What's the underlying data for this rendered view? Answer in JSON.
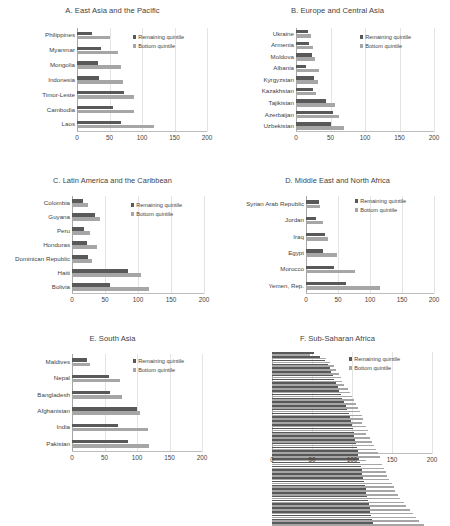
{
  "figure": {
    "legend_labels": {
      "remaining": "Remaining quintile",
      "bottom": "Bottom quintile"
    },
    "colors": {
      "remaining": "#595959",
      "bottom": "#a6a6a6",
      "gridline": "#e4e4e4",
      "axis": "#a6a6a6",
      "text": "#3f3f3f",
      "background": "#ffffff"
    }
  },
  "chart_data": [
    {
      "id": "A",
      "type": "bar",
      "orientation": "horizontal",
      "title": "A. East Asia and the Pacific",
      "xlabel": "",
      "ylabel": "",
      "xlim": [
        0,
        200
      ],
      "xticks": [
        0,
        50,
        100,
        150,
        200
      ],
      "grid": true,
      "legend_position": "upper-right",
      "categories": [
        "Philippines",
        "Myanmar",
        "Mongolia",
        "Indonesia",
        "Timor-Leste",
        "Cambodia",
        "Laos"
      ],
      "series": [
        {
          "name": "Remaining quintile",
          "values": [
            23,
            37,
            33,
            34,
            73,
            55,
            68
          ]
        },
        {
          "name": "Bottom quintile",
          "values": [
            50,
            63,
            68,
            70,
            87,
            88,
            118
          ]
        }
      ]
    },
    {
      "id": "B",
      "type": "bar",
      "orientation": "horizontal",
      "title": "B. Europe and Central Asia",
      "xlabel": "",
      "ylabel": "",
      "xlim": [
        0,
        200
      ],
      "xticks": [
        0,
        50,
        100,
        150,
        200
      ],
      "grid": true,
      "legend_position": "upper-right",
      "categories": [
        "Ukraine",
        "Armenia",
        "Moldova",
        "Albania",
        "Kyrgyzstan",
        "Kazakhstan",
        "Tajikistan",
        "Azerbaijan",
        "Uzbekistan"
      ],
      "series": [
        {
          "name": "Remaining quintile",
          "values": [
            17,
            19,
            23,
            14,
            26,
            24,
            44,
            53,
            51
          ]
        },
        {
          "name": "Bottom quintile",
          "values": [
            22,
            24,
            28,
            34,
            32,
            29,
            57,
            62,
            70
          ]
        }
      ]
    },
    {
      "id": "C",
      "type": "bar",
      "orientation": "horizontal",
      "title": "C. Latin America and the Caribbean",
      "xlabel": "",
      "ylabel": "",
      "xlim": [
        0,
        200
      ],
      "xticks": [
        0,
        50,
        100,
        150,
        200
      ],
      "grid": true,
      "legend_position": "upper-right",
      "categories": [
        "Colombia",
        "Guyana",
        "Peru",
        "Honduras",
        "Dominican Republic",
        "Haiti",
        "Bolivia"
      ],
      "series": [
        {
          "name": "Remaining quintile",
          "values": [
            16,
            35,
            18,
            22,
            24,
            85,
            57
          ]
        },
        {
          "name": "Bottom quintile",
          "values": [
            24,
            43,
            28,
            38,
            31,
            104,
            117
          ]
        }
      ]
    },
    {
      "id": "D",
      "type": "bar",
      "orientation": "horizontal",
      "title": "D. Middle East and North Africa",
      "xlabel": "",
      "ylabel": "",
      "xlim": [
        0,
        200
      ],
      "xticks": [
        0,
        50,
        100,
        150,
        200
      ],
      "grid": true,
      "legend_position": "upper-right",
      "categories": [
        "Syrian Arab Republic",
        "Jordan",
        "Iraq",
        "Egypt",
        "Morocco",
        "Yemen, Rep."
      ],
      "series": [
        {
          "name": "Remaining quintile",
          "values": [
            21,
            15,
            30,
            27,
            44,
            63
          ]
        },
        {
          "name": "Bottom quintile",
          "values": [
            22,
            27,
            35,
            48,
            76,
            116
          ]
        }
      ]
    },
    {
      "id": "E",
      "type": "bar",
      "orientation": "horizontal",
      "title": "E. South Asia",
      "xlabel": "",
      "ylabel": "",
      "xlim": [
        0,
        200
      ],
      "xticks": [
        0,
        50,
        100,
        150,
        200
      ],
      "grid": true,
      "legend_position": "upper-right",
      "categories": [
        "Maldives",
        "Nepal",
        "Bangladesh",
        "Afghanistan",
        "India",
        "Pakistan"
      ],
      "series": [
        {
          "name": "Remaining quintile",
          "values": [
            23,
            57,
            58,
            100,
            71,
            86
          ]
        },
        {
          "name": "Bottom quintile",
          "values": [
            28,
            74,
            77,
            105,
            117,
            118
          ]
        }
      ]
    },
    {
      "id": "F",
      "type": "bar",
      "orientation": "horizontal",
      "title": "F. Sub-Saharan Africa",
      "xlabel": "",
      "ylabel": "",
      "xlim": [
        0,
        200
      ],
      "xticks": [
        0,
        50,
        100,
        150,
        200
      ],
      "grid": true,
      "legend_position": "upper-right",
      "note": "Country labels rendered below legible resolution in source image",
      "categories": [
        "",
        "",
        "",
        "",
        "",
        "",
        "",
        "",
        "",
        "",
        "",
        "",
        "",
        "",
        "",
        "",
        "",
        "",
        "",
        "",
        "",
        "",
        "",
        "",
        "",
        "",
        "",
        "",
        "",
        "",
        "",
        "",
        "",
        "",
        "",
        "",
        "",
        "",
        "",
        "",
        "",
        "",
        "",
        "",
        "",
        ""
      ],
      "series": [
        {
          "name": "Remaining quintile",
          "values": [
            52,
            60,
            66,
            70,
            72,
            74,
            76,
            78,
            80,
            82,
            84,
            86,
            88,
            90,
            92,
            94,
            96,
            98,
            99,
            100,
            101,
            102,
            103,
            104,
            105,
            106,
            107,
            108,
            109,
            110,
            111,
            112,
            113,
            114,
            115,
            116,
            117,
            118,
            119,
            120,
            121,
            122,
            123,
            124,
            125,
            126
          ]
        },
        {
          "name": "Bottom quintile",
          "values": [
            48,
            68,
            72,
            78,
            80,
            84,
            86,
            88,
            90,
            95,
            98,
            100,
            103,
            105,
            108,
            110,
            112,
            114,
            113,
            118,
            120,
            117,
            122,
            125,
            128,
            130,
            133,
            135,
            118,
            138,
            140,
            142,
            144,
            146,
            150,
            152,
            154,
            158,
            160,
            165,
            168,
            172,
            176,
            180,
            184,
            190
          ]
        }
      ]
    }
  ]
}
